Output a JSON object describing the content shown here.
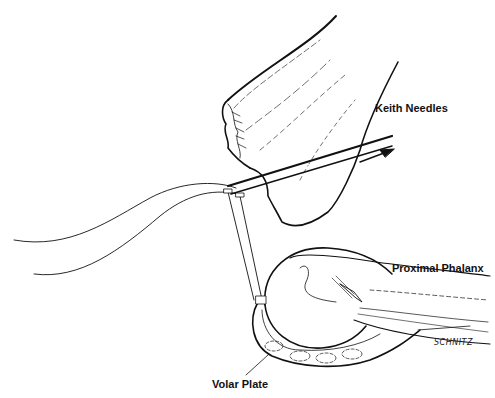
{
  "figure": {
    "labels": {
      "keith_needles": "Keith Needles",
      "proximal_phalanx": "Proximal Phalanx",
      "volar_plate": "Volar Plate"
    },
    "signature": "SCHNITZ",
    "colors": {
      "ink": "#111111",
      "background": "#ffffff"
    }
  }
}
